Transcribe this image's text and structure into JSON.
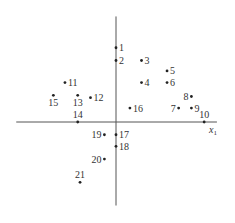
{
  "diagram": {
    "type": "labeled point scatter on axes",
    "axis_labels": {
      "x": "x",
      "x_subscript": "1"
    },
    "points": [
      {
        "label": "1",
        "x": 0,
        "y": 6.4,
        "label_side": "right"
      },
      {
        "label": "2",
        "x": 0,
        "y": 5.3,
        "label_side": "right"
      },
      {
        "label": "3",
        "x": 2.2,
        "y": 5.3,
        "label_side": "right"
      },
      {
        "label": "4",
        "x": 2.2,
        "y": 3.4,
        "label_side": "right"
      },
      {
        "label": "5",
        "x": 4.4,
        "y": 4.4,
        "label_side": "right"
      },
      {
        "label": "6",
        "x": 4.4,
        "y": 3.4,
        "label_side": "right"
      },
      {
        "label": "7",
        "x": 5.4,
        "y": 1.2,
        "label_side": "left"
      },
      {
        "label": "8",
        "x": 6.5,
        "y": 2.2,
        "label_side": "left"
      },
      {
        "label": "9",
        "x": 6.5,
        "y": 1.2,
        "label_side": "right"
      },
      {
        "label": "10",
        "x": 7.6,
        "y": 0,
        "label_side": "above"
      },
      {
        "label": "11",
        "x": -4.4,
        "y": 3.4,
        "label_side": "right"
      },
      {
        "label": "12",
        "x": -2.2,
        "y": 2.1,
        "label_side": "right"
      },
      {
        "label": "13",
        "x": -3.3,
        "y": 2.3,
        "label_side": "below"
      },
      {
        "label": "14",
        "x": -3.3,
        "y": 0,
        "label_side": "above"
      },
      {
        "label": "15",
        "x": -5.4,
        "y": 2.3,
        "label_side": "below"
      },
      {
        "label": "16",
        "x": 1.2,
        "y": 1.2,
        "label_side": "right"
      },
      {
        "label": "17",
        "x": 0,
        "y": -1.1,
        "label_side": "right"
      },
      {
        "label": "18",
        "x": 0,
        "y": -2.1,
        "label_side": "right"
      },
      {
        "label": "19",
        "x": -1.0,
        "y": -1.1,
        "label_side": "left"
      },
      {
        "label": "20",
        "x": -1.0,
        "y": -3.2,
        "label_side": "left"
      },
      {
        "label": "21",
        "x": -3.1,
        "y": -5.2,
        "label_side": "above"
      }
    ],
    "x_range": [
      -8.6,
      8.7
    ],
    "y_range": [
      -7.2,
      9.1
    ]
  }
}
